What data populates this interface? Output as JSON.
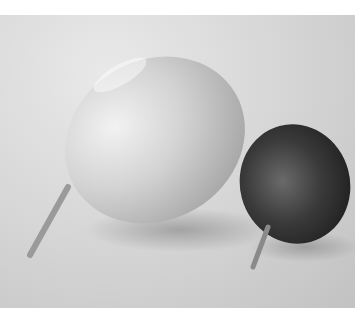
{
  "image": {
    "description": "Grayscale photo of two fruits on a light surface: a large pale oval fruit with a stem on the left and a smaller dark round fruit with a stem on the right",
    "subjects": [
      {
        "name": "large-pale-fruit",
        "tone": "light"
      },
      {
        "name": "small-dark-fruit",
        "tone": "dark"
      }
    ],
    "colors": {
      "background": "#d6d6d6",
      "large_fruit": "#cfcfcf",
      "small_fruit": "#2e2e2e",
      "stem": "#9a9a9a",
      "shadow": "#9c9c9c"
    }
  }
}
